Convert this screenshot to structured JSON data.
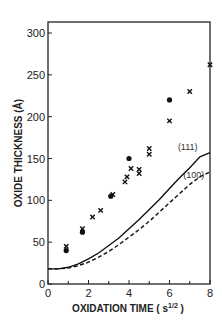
{
  "chart_data": {
    "type": "scatter",
    "title": "",
    "xlabel": "OXIDATION TIME ( s",
    "xlabel_sup": "1/2",
    "xlabel_close": " )",
    "ylabel": "OXIDE THICKNESS (Å)",
    "xlim": [
      0,
      8
    ],
    "ylim": [
      0,
      300
    ],
    "x_ticks": [
      0,
      2,
      4,
      6,
      8
    ],
    "x_tick_labels": [
      "0",
      "2",
      "4",
      "6",
      "8"
    ],
    "x_minor_ticks": [
      1,
      3,
      5,
      7
    ],
    "y_ticks": [
      0,
      50,
      100,
      150,
      200,
      250,
      300
    ],
    "y_tick_labels": [
      "0",
      "50",
      "100",
      "150",
      "200",
      "250",
      "300"
    ],
    "grid": false,
    "legend": null,
    "series": [
      {
        "name": "measured (dots)",
        "marker": "circle",
        "points": [
          [
            0.9,
            40
          ],
          [
            1.7,
            62
          ],
          [
            3.1,
            105
          ],
          [
            4.0,
            150
          ],
          [
            6.0,
            220
          ]
        ]
      },
      {
        "name": "measured (crosses)",
        "marker": "x",
        "points": [
          [
            0.9,
            45
          ],
          [
            1.7,
            66
          ],
          [
            2.2,
            80
          ],
          [
            2.6,
            88
          ],
          [
            3.2,
            107
          ],
          [
            3.8,
            122
          ],
          [
            3.9,
            128
          ],
          [
            4.1,
            138
          ],
          [
            4.5,
            132
          ],
          [
            4.5,
            137
          ],
          [
            5.0,
            155
          ],
          [
            5.0,
            162
          ],
          [
            6.0,
            195
          ],
          [
            7.0,
            230
          ],
          [
            8.0,
            262
          ]
        ]
      },
      {
        "name": "(111)",
        "style": "solid",
        "points": [
          [
            0,
            18
          ],
          [
            0.5,
            18
          ],
          [
            1,
            20
          ],
          [
            1.5,
            24
          ],
          [
            2,
            30
          ],
          [
            2.5,
            37
          ],
          [
            3,
            46
          ],
          [
            3.5,
            55
          ],
          [
            4,
            66
          ],
          [
            4.5,
            77
          ],
          [
            5,
            89
          ],
          [
            5.5,
            101
          ],
          [
            6,
            114
          ],
          [
            6.5,
            127
          ],
          [
            7,
            139
          ],
          [
            7.5,
            152
          ],
          [
            8,
            157
          ]
        ]
      },
      {
        "name": "(100)",
        "style": "dashed",
        "points": [
          [
            0,
            18
          ],
          [
            0.5,
            18
          ],
          [
            1,
            19
          ],
          [
            1.5,
            22
          ],
          [
            2,
            26
          ],
          [
            2.5,
            32
          ],
          [
            3,
            39
          ],
          [
            3.5,
            47
          ],
          [
            4,
            56
          ],
          [
            4.5,
            65
          ],
          [
            5,
            75
          ],
          [
            5.5,
            86
          ],
          [
            6,
            97
          ],
          [
            6.5,
            108
          ],
          [
            7,
            119
          ],
          [
            7.5,
            128
          ],
          [
            8,
            134
          ]
        ]
      }
    ],
    "annotations": [
      {
        "text": "(111)",
        "x": 6.9,
        "y": 160
      },
      {
        "text": "(100)",
        "x": 7.2,
        "y": 127
      }
    ]
  }
}
